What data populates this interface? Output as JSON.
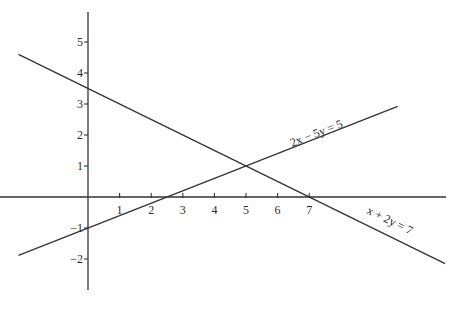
{
  "chart_data": {
    "type": "line",
    "title": "",
    "xlabel": "",
    "ylabel": "",
    "xlim": [
      -2.2,
      11.3
    ],
    "ylim": [
      -2.9,
      6.0
    ],
    "grid": false,
    "x_ticks": [
      1,
      2,
      3,
      4,
      5,
      6,
      7
    ],
    "x_tick_labels": [
      "1",
      "2",
      "3",
      "4",
      "5",
      "6",
      "7"
    ],
    "y_ticks": [
      5,
      4,
      3,
      2,
      1,
      -1,
      -2
    ],
    "y_tick_labels": [
      "5",
      "4",
      "3",
      "2",
      "1",
      "−1",
      "−2"
    ],
    "series": [
      {
        "name": "x + 2y = 7",
        "label": "x + 2y = 7",
        "equation": "x + 2y = 7",
        "x": [
          -2.2,
          11.3
        ],
        "y": [
          4.6,
          -2.15
        ]
      },
      {
        "name": "2x − 5y = 5",
        "label": "2x − 5y = 5",
        "equation": "2x − 5y = 5",
        "x": [
          -2.2,
          9.8
        ],
        "y": [
          -1.88,
          2.92
        ]
      }
    ],
    "annotations": [
      {
        "text": "2x − 5y = 5",
        "near": [
          6.5,
          1.8
        ]
      },
      {
        "text": "x + 2y = 7",
        "near": [
          9.2,
          -1.2
        ]
      }
    ],
    "intersections": [
      {
        "x": 5,
        "y": 1
      },
      {
        "x": 7,
        "y": 0
      },
      {
        "x": 2.5,
        "y": 0
      },
      {
        "x": 0,
        "y": 3.5
      },
      {
        "x": 0,
        "y": -1
      }
    ]
  },
  "labels": {
    "eq1": "2x − 5y = 5",
    "eq2": "x + 2y = 7"
  }
}
